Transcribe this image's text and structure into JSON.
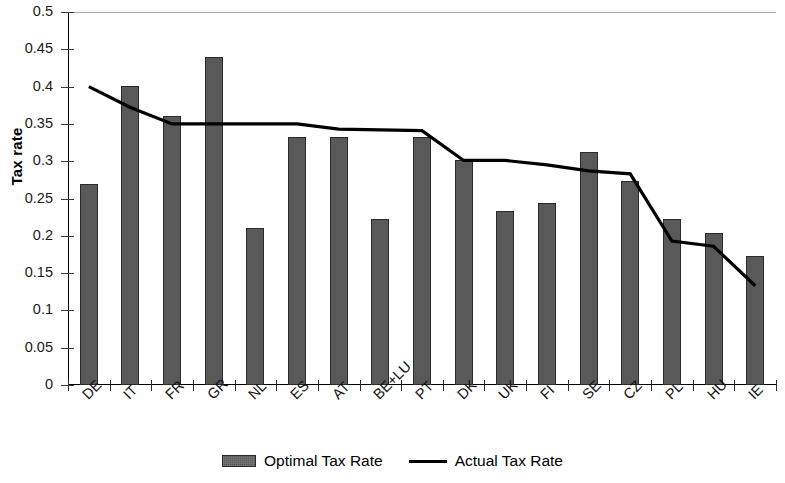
{
  "chart_data": {
    "type": "bar",
    "title": "",
    "xlabel": "",
    "ylabel": "Tax rate",
    "ylim": [
      0,
      0.5
    ],
    "ytick_labels": [
      "0.5",
      "0.45",
      "0.4",
      "0.35",
      "0.3",
      "0.25",
      "0.2",
      "0.15",
      "0.1",
      "0.05",
      "0"
    ],
    "ytick_values": [
      0.5,
      0.45,
      0.4,
      0.35,
      0.3,
      0.25,
      0.2,
      0.15,
      0.1,
      0.05,
      0
    ],
    "grid": false,
    "legend_position": "bottom-center",
    "categories": [
      "DE",
      "IT",
      "FR",
      "GR",
      "NL",
      "ES",
      "AT",
      "BE+LU",
      "PT",
      "DK",
      "UK",
      "FI",
      "SE",
      "CZ",
      "PL",
      "HU",
      "IE"
    ],
    "series": [
      {
        "name": "Optimal Tax Rate",
        "type": "bar",
        "color": "#595959",
        "values": [
          0.27,
          0.401,
          0.36,
          0.44,
          0.211,
          0.332,
          0.332,
          0.222,
          0.332,
          0.301,
          0.233,
          0.244,
          0.313,
          0.274,
          0.223,
          0.204,
          0.173
        ]
      },
      {
        "name": "Actual Tax Rate",
        "type": "line",
        "color": "#000000",
        "values": [
          0.4,
          0.372,
          0.35,
          0.35,
          0.35,
          0.35,
          0.343,
          0.342,
          0.341,
          0.301,
          0.301,
          0.295,
          0.287,
          0.283,
          0.193,
          0.186,
          0.133
        ]
      }
    ]
  },
  "legend": {
    "items": [
      {
        "label": "Optimal Tax Rate",
        "marker": "bar-swatch"
      },
      {
        "label": "Actual Tax Rate",
        "marker": "line-swatch"
      }
    ]
  },
  "axes": {
    "y_title": "Tax rate"
  }
}
